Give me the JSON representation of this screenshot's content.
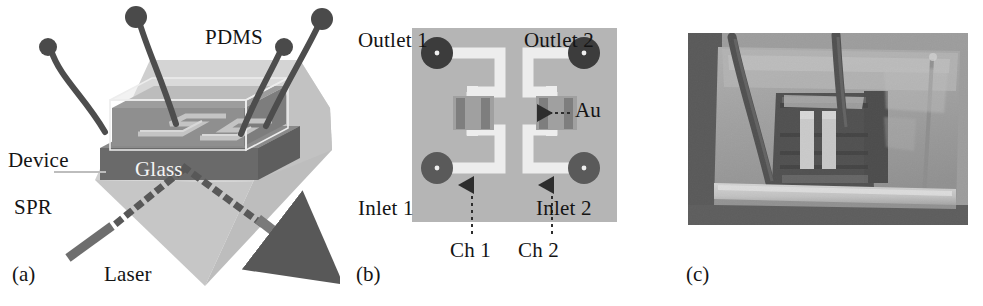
{
  "figure": {
    "caption_panels": [
      "(a)",
      "(b)",
      "(c)"
    ],
    "width": 983,
    "height": 306,
    "background": "#ffffff"
  },
  "panel_a": {
    "tag": "(a)",
    "description": "Schematic of microfluidic device on SPR prism",
    "labels": {
      "pdms": "PDMS",
      "glass": "Glass",
      "device": "Device",
      "spr": "SPR",
      "laser": "Laser"
    },
    "colors": {
      "prism": "#c9c9c9",
      "prism_side": "#b0b0b0",
      "glass": "#6d6d6d",
      "pdms_block": "#8d8d8d",
      "pdms_top": "#a5a5a5",
      "channel": "#bdbdbd",
      "tubing": "#4a4a4a",
      "connector": "#5a5a5a",
      "beam": "#585858",
      "laser_bar": "#6e6e6e"
    },
    "tube_count": 4,
    "beam_style": "dotted"
  },
  "panel_b": {
    "tag": "(b)",
    "description": "Top view of two-channel microfluidic chip layout",
    "labels": {
      "outlet1": "Outlet 1",
      "outlet2": "Outlet 2",
      "inlet1": "Inlet 1",
      "inlet2": "Inlet 2",
      "au": "Au",
      "ch1": "Ch 1",
      "ch2": "Ch 2"
    },
    "colors": {
      "substrate": "#b5b5b5",
      "channel": "#eaeaea",
      "port": "#3c3c3c",
      "port_center": "#f0f0f0",
      "gold_pad": "#9a9a9a",
      "gold_stripe": "#7d7d7d",
      "arrow": "#2d2d2d"
    },
    "ports": [
      {
        "name": "Outlet 1",
        "x": 48,
        "y": 53
      },
      {
        "name": "Outlet 2",
        "x": 192,
        "y": 53
      },
      {
        "name": "Inlet 1",
        "x": 48,
        "y": 168
      },
      {
        "name": "Inlet 2",
        "x": 192,
        "y": 168
      }
    ],
    "channels": [
      "Ch 1",
      "Ch 2"
    ],
    "gold_pad_count": 2
  },
  "panel_c": {
    "tag": "(c)",
    "description": "Photograph of the assembled PDMS microfluidic chip with tubing on a glass slide",
    "colors": {
      "photo_bg": "#9b9b9b",
      "pdms_clear": "#a8a8a8",
      "dark_region": "#3e3e3e",
      "gold_strip": "#d2d2d2",
      "slide_edge": "#d9d9d9",
      "tubing": "#4f4f4f"
    }
  }
}
